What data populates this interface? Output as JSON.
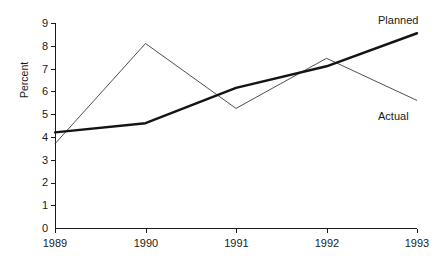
{
  "chart_data": {
    "type": "line",
    "title": "",
    "subtitle": "",
    "xlabel": "",
    "ylabel": "Percent",
    "categories": [
      "1989",
      "1990",
      "1991",
      "1992",
      "1993"
    ],
    "x": [
      1989,
      1990,
      1991,
      1992,
      1993
    ],
    "xlim": [
      1989,
      1993
    ],
    "ylim": [
      0,
      9
    ],
    "yticks": [
      0,
      1,
      2,
      3,
      4,
      5,
      6,
      7,
      8,
      9
    ],
    "ytick_labels": [
      "0",
      "1",
      "2",
      "3",
      "4",
      "5",
      "6",
      "7",
      "8",
      "9"
    ],
    "xtick_labels": [
      "1989",
      "1990",
      "1991",
      "1992",
      "1993"
    ],
    "grid": false,
    "legend_position": "inline-end-of-line",
    "series": [
      {
        "name": "Planned",
        "values": [
          4.2,
          4.6,
          6.15,
          7.1,
          8.55
        ],
        "style": "thick-solid",
        "color": "#141414",
        "label": "Planned"
      },
      {
        "name": "Actual",
        "values": [
          3.7,
          8.1,
          5.25,
          7.45,
          5.6
        ],
        "style": "thin-solid",
        "color": "#3a3a3a",
        "label": "Actual"
      }
    ],
    "annotations": [
      {
        "text": "Planned",
        "series": "Planned",
        "anchor": "end"
      },
      {
        "text": "Actual",
        "series": "Actual",
        "anchor": "end"
      }
    ]
  },
  "axes": {
    "y_title": "Percent",
    "y_tick_0": "0",
    "y_tick_1": "1",
    "y_tick_2": "2",
    "y_tick_3": "3",
    "y_tick_4": "4",
    "y_tick_5": "5",
    "y_tick_6": "6",
    "y_tick_7": "7",
    "y_tick_8": "8",
    "y_tick_9": "9",
    "x_tick_0": "1989",
    "x_tick_1": "1990",
    "x_tick_2": "1991",
    "x_tick_3": "1992",
    "x_tick_4": "1993"
  },
  "labels": {
    "planned": "Planned",
    "actual": "Actual"
  },
  "colors": {
    "background": "#ffffff",
    "axis": "#1a1a1a",
    "planned_line": "#141414",
    "actual_line": "#3a3a3a",
    "text": "#1a1a1a"
  }
}
